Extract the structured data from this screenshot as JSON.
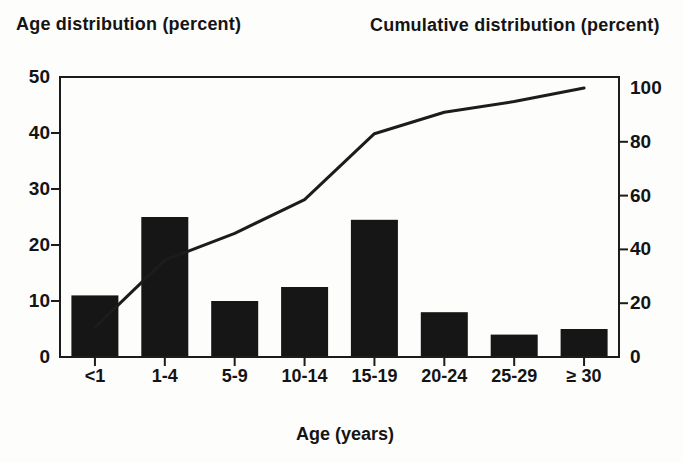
{
  "figure": {
    "background_color": "#fdfdfc",
    "ink_color": "#161616"
  },
  "chart_data": {
    "type": "bar",
    "subtype": "bar-with-cumulative-line",
    "categories": [
      "<1",
      "1-4",
      "5-9",
      "10-14",
      "15-19",
      "20-24",
      "25-29",
      "≥ 30"
    ],
    "series": [
      {
        "name": "Age distribution",
        "type": "bar",
        "axis": "left",
        "values": [
          11,
          25,
          10,
          12.5,
          24.5,
          8,
          4,
          5
        ]
      },
      {
        "name": "Cumulative distribution",
        "type": "line",
        "axis": "right",
        "values": [
          11,
          36,
          46,
          58.5,
          83,
          91,
          95,
          100
        ]
      }
    ],
    "left_axis": {
      "title": "Age distribution (percent)",
      "min": 0,
      "max": 50,
      "ticks": [
        0,
        10,
        20,
        30,
        40,
        50
      ]
    },
    "right_axis": {
      "title": "Cumulative distribution (percent)",
      "min": 0,
      "max": 100,
      "ticks": [
        0,
        20,
        40,
        60,
        80,
        100
      ]
    },
    "xlabel": "Age (years)",
    "grid": false,
    "legend": "none",
    "bar_color": "#161616",
    "line_color": "#1c1c1c",
    "frame_color": "#1c1c1c"
  }
}
